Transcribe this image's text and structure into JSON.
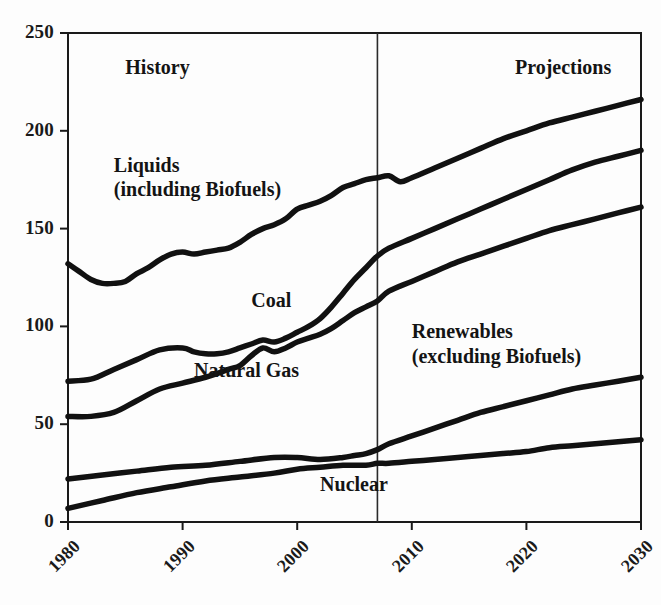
{
  "chart_data": {
    "type": "line",
    "title": "",
    "subtitle": "",
    "xlabel": "",
    "ylabel": "",
    "xlim": [
      1980,
      2030
    ],
    "ylim": [
      0,
      250
    ],
    "grid": false,
    "legend_position": "inline-annotations",
    "y_ticks": [
      0,
      50,
      100,
      150,
      200,
      250
    ],
    "x_ticks": [
      1980,
      1990,
      2000,
      2010,
      2020,
      2030
    ],
    "history_projection_divider_x": 2007,
    "annotations": [
      {
        "text": "History",
        "x": 1985,
        "y": 232
      },
      {
        "text": "Projections",
        "x": 2019,
        "y": 232
      },
      {
        "text": "Liquids",
        "x": 1984,
        "y": 182
      },
      {
        "text": "(including Biofuels)",
        "x": 1984,
        "y": 171
      },
      {
        "text": "Coal",
        "x": 1996,
        "y": 113
      },
      {
        "text": "Natural Gas",
        "x": 1991,
        "y": 77
      },
      {
        "text": "Renewables",
        "x": 2010,
        "y": 97
      },
      {
        "text": "(excluding Biofuels)",
        "x": 2010,
        "y": 86
      },
      {
        "text": "Nuclear",
        "x": 2002,
        "y": 19
      }
    ],
    "series": [
      {
        "name": "Liquids (including Biofuels)",
        "color": "#111111",
        "x": [
          1980,
          1981,
          1982,
          1983,
          1984,
          1985,
          1986,
          1987,
          1988,
          1989,
          1990,
          1991,
          1992,
          1993,
          1994,
          1995,
          1996,
          1997,
          1998,
          1999,
          2000,
          2001,
          2002,
          2003,
          2004,
          2005,
          2006,
          2007,
          2008,
          2009,
          2010,
          2012,
          2014,
          2016,
          2018,
          2020,
          2022,
          2024,
          2026,
          2028,
          2030
        ],
        "values": [
          132,
          128,
          124,
          122,
          122,
          123,
          127,
          130,
          134,
          137,
          138,
          137,
          138,
          139,
          140,
          143,
          147,
          150,
          152,
          155,
          160,
          162,
          164,
          167,
          171,
          173,
          175,
          176,
          177,
          174,
          176,
          181,
          186,
          191,
          196,
          200,
          204,
          207,
          210,
          213,
          216
        ]
      },
      {
        "name": "Coal",
        "color": "#111111",
        "x": [
          1980,
          1982,
          1984,
          1986,
          1988,
          1990,
          1991,
          1992,
          1993,
          1994,
          1995,
          1996,
          1997,
          1998,
          1999,
          2000,
          2001,
          2002,
          2003,
          2004,
          2005,
          2006,
          2007,
          2008,
          2010,
          2012,
          2014,
          2016,
          2018,
          2020,
          2022,
          2024,
          2026,
          2028,
          2030
        ],
        "values": [
          72,
          73,
          78,
          83,
          88,
          89,
          87,
          86,
          86,
          87,
          89,
          91,
          93,
          92,
          94,
          97,
          100,
          104,
          110,
          117,
          124,
          130,
          136,
          140,
          145,
          150,
          155,
          160,
          165,
          170,
          175,
          180,
          184,
          187,
          190
        ]
      },
      {
        "name": "Natural Gas",
        "color": "#111111",
        "x": [
          1980,
          1982,
          1984,
          1986,
          1988,
          1990,
          1992,
          1994,
          1995,
          1996,
          1997,
          1998,
          1999,
          2000,
          2001,
          2002,
          2003,
          2004,
          2005,
          2006,
          2007,
          2008,
          2010,
          2012,
          2014,
          2016,
          2018,
          2020,
          2022,
          2024,
          2026,
          2028,
          2030
        ],
        "values": [
          54,
          54,
          56,
          62,
          68,
          71,
          74,
          78,
          80,
          85,
          89,
          87,
          89,
          92,
          94,
          96,
          99,
          103,
          107,
          110,
          113,
          118,
          123,
          128,
          133,
          137,
          141,
          145,
          149,
          152,
          155,
          158,
          161
        ]
      },
      {
        "name": "Renewables (excluding Biofuels)",
        "color": "#111111",
        "x": [
          1980,
          1983,
          1986,
          1989,
          1992,
          1995,
          1998,
          2000,
          2002,
          2004,
          2005,
          2006,
          2007,
          2008,
          2010,
          2012,
          2014,
          2016,
          2018,
          2020,
          2022,
          2024,
          2026,
          2028,
          2030
        ],
        "values": [
          22,
          24,
          26,
          28,
          29,
          31,
          33,
          33,
          32,
          33,
          34,
          35,
          37,
          40,
          44,
          48,
          52,
          56,
          59,
          62,
          65,
          68,
          70,
          72,
          74
        ]
      },
      {
        "name": "Nuclear",
        "color": "#111111",
        "x": [
          1980,
          1983,
          1986,
          1989,
          1992,
          1995,
          1998,
          2000,
          2002,
          2004,
          2006,
          2007,
          2008,
          2010,
          2012,
          2014,
          2016,
          2018,
          2020,
          2022,
          2024,
          2026,
          2028,
          2030
        ],
        "values": [
          7,
          11,
          15,
          18,
          21,
          23,
          25,
          27,
          28,
          29,
          29,
          30,
          30,
          31,
          32,
          33,
          34,
          35,
          36,
          38,
          39,
          40,
          41,
          42
        ]
      }
    ]
  },
  "axes": {
    "y_tick_labels": [
      "250",
      "200",
      "150",
      "100",
      "50",
      "0"
    ],
    "x_tick_labels": [
      "1980",
      "1990",
      "2000",
      "2010",
      "2020",
      "2030"
    ]
  },
  "labels": {
    "history": "History",
    "projections": "Projections",
    "liquids_line1": "Liquids",
    "liquids_line2": "(including Biofuels)",
    "coal": "Coal",
    "natural_gas": "Natural Gas",
    "renewables_line1": "Renewables",
    "renewables_line2": "(excluding Biofuels)",
    "nuclear": "Nuclear"
  },
  "colors": {
    "line": "#111111",
    "axis": "#1a1a1a",
    "divider": "#2a2a2a",
    "background": "#fdfdfd"
  }
}
